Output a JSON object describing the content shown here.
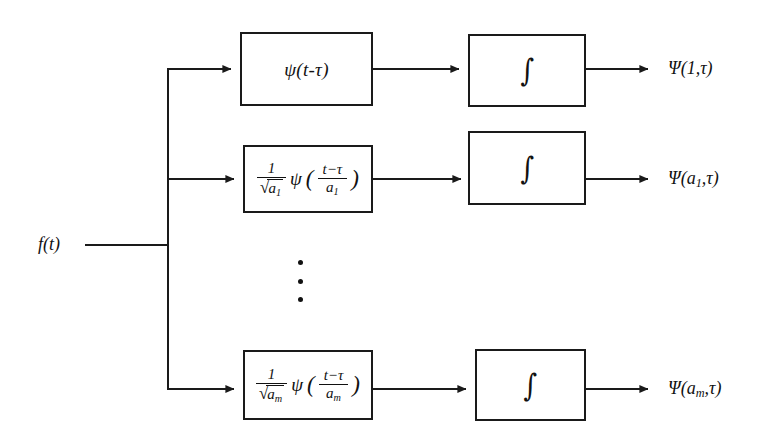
{
  "diagram": {
    "background_color": "#ffffff",
    "line_color": "#1a1a1a",
    "input": {
      "label": "f(t)",
      "name": "input-signal-label"
    },
    "rows": [
      {
        "id": "row-1",
        "wavelet_box": {
          "type": "simple",
          "text": "ψ(t-τ)",
          "psi": "ψ",
          "arg": "(t-τ)"
        },
        "integral_box": {
          "symbol": "∫"
        },
        "output_label": {
          "psi": "Ψ",
          "open": "(",
          "scale": "1",
          "comma": ",",
          "tau": "τ",
          "close": ")",
          "full": "Ψ(1,τ)"
        }
      },
      {
        "id": "row-2",
        "wavelet_box": {
          "type": "scaled",
          "numerator": "1",
          "radical_sign": "√",
          "radical_body": "a",
          "radical_sub": "1",
          "psi": "ψ",
          "open_paren": "(",
          "inner_numerator": "t−τ",
          "inner_denominator": "a",
          "inner_denominator_sub": "1",
          "close_paren": ")",
          "full": "1/√a₁ ψ((t−τ)/a₁)"
        },
        "integral_box": {
          "symbol": "∫"
        },
        "output_label": {
          "psi": "Ψ",
          "open": "(",
          "scale": "a",
          "scale_sub": "1",
          "comma": ",",
          "tau": "τ",
          "close": ")",
          "full": "Ψ(a₁,τ)"
        }
      },
      {
        "id": "row-3",
        "wavelet_box": {
          "type": "scaled",
          "numerator": "1",
          "radical_sign": "√",
          "radical_body": "a",
          "radical_sub": "m",
          "psi": "ψ",
          "open_paren": "(",
          "inner_numerator": "t−τ",
          "inner_denominator": "a",
          "inner_denominator_sub": "m",
          "close_paren": ")",
          "full": "1/√a_m ψ((t−τ)/a_m)"
        },
        "integral_box": {
          "symbol": "∫"
        },
        "output_label": {
          "psi": "Ψ",
          "open": "(",
          "scale": "a",
          "scale_sub": "m",
          "comma": ",",
          "tau": "τ",
          "close": ")",
          "full": "Ψ(a_m,τ)"
        }
      }
    ],
    "continuation": {
      "name": "vertical-ellipsis",
      "dot_count": 3
    }
  }
}
